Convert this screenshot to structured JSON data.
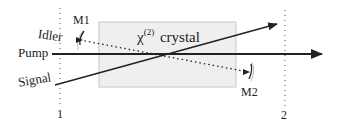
{
  "diagram": {
    "crystal": {
      "symbol": "χ",
      "superscript": "(2)",
      "word": "crystal",
      "fill": "#efefef",
      "stroke": "#c8c8c8"
    },
    "beams": {
      "pump": {
        "label": "Pump"
      },
      "signal": {
        "label": "Signal"
      },
      "idler": {
        "label": "Idler"
      }
    },
    "mirrors": {
      "m1": {
        "label": "M1"
      },
      "m2": {
        "label": "M2"
      }
    },
    "planes": {
      "plane1": {
        "label": "1"
      },
      "plane2": {
        "label": "2"
      }
    },
    "colors": {
      "line": "#222222",
      "background": "#ffffff"
    }
  }
}
